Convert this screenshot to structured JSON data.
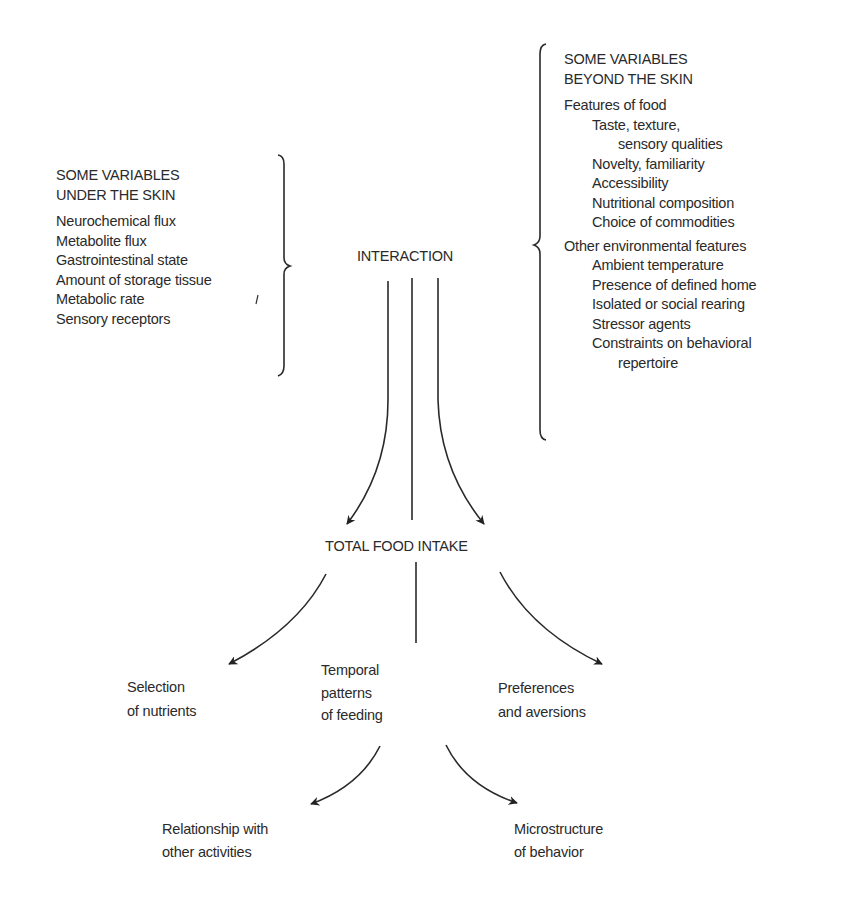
{
  "under_skin": {
    "heading": [
      "SOME VARIABLES",
      "UNDER THE SKIN"
    ],
    "items": [
      "Neurochemical flux",
      "Metabolite flux",
      "Gastrointestinal state",
      "Amount of storage tissue",
      "Metabolic rate",
      "Sensory receptors"
    ]
  },
  "beyond_skin": {
    "heading": [
      "SOME VARIABLES",
      "BEYOND THE SKIN"
    ],
    "groups": [
      {
        "title": "Features of food",
        "items": [
          {
            "text": "Taste, texture,",
            "indent": 1
          },
          {
            "text": "sensory qualities",
            "indent": 2
          },
          {
            "text": "Novelty, familiarity",
            "indent": 1
          },
          {
            "text": "Accessibility",
            "indent": 1
          },
          {
            "text": "Nutritional composition",
            "indent": 1
          },
          {
            "text": "Choice of commodities",
            "indent": 1
          }
        ]
      },
      {
        "title": "Other environmental features",
        "items": [
          {
            "text": "Ambient temperature",
            "indent": 1
          },
          {
            "text": "Presence of defined home",
            "indent": 1
          },
          {
            "text": "Isolated or social rearing",
            "indent": 1
          },
          {
            "text": "Stressor agents",
            "indent": 1
          },
          {
            "text": "Constraints on behavioral",
            "indent": 1
          },
          {
            "text": "repertoire",
            "indent": 2
          }
        ]
      }
    ]
  },
  "nodes": {
    "interaction": "INTERACTION",
    "total_food_intake": "TOTAL FOOD INTAKE",
    "selection": [
      "Selection",
      "of nutrients"
    ],
    "temporal": [
      "Temporal",
      "patterns",
      "of feeding"
    ],
    "preferences": [
      "Preferences",
      "and aversions"
    ],
    "relationship": [
      "Relationship with",
      "other activities"
    ],
    "microstructure": [
      "Microstructure",
      "of behavior"
    ]
  }
}
